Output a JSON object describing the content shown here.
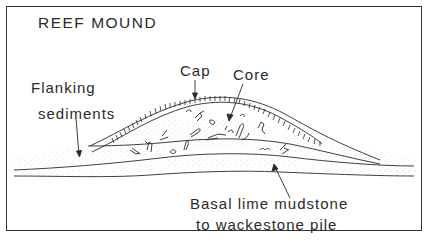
{
  "diagram": {
    "title": "REEF MOUND",
    "labels": {
      "cap": "Cap",
      "core": "Core",
      "flanking_line1": "Flanking",
      "flanking_line2": "sediments",
      "basal_line1": "Basal lime mudstone",
      "basal_line2": "to wackestone pile"
    },
    "colors": {
      "line": "#2a2a2a",
      "frame": "#333333",
      "stipple": "#b5b5b5",
      "background": "#ffffff"
    }
  }
}
